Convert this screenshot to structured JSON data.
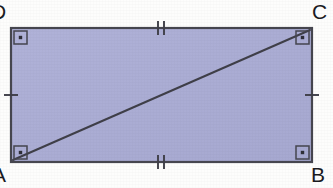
{
  "figure": {
    "kind": "geometry-diagram",
    "shape_name": "rectangle-with-diagonal",
    "colors": {
      "fill": "#aaacd4",
      "fill_light": "#b6b8de",
      "stroke": "#46464f",
      "diagonal": "#3f3f48",
      "label": "#1b1b1f",
      "background": "#fdfdfc"
    },
    "rect": {
      "x": 11,
      "y": 28,
      "width": 301,
      "height": 134,
      "stroke_width": 2.2
    },
    "diagonal": {
      "from": "A",
      "to": "C",
      "x1": 13,
      "y1": 160,
      "x2": 310,
      "y2": 30,
      "stroke_width": 2.0
    },
    "vertices": [
      {
        "id": "D",
        "label": "D",
        "position": "top-left",
        "x": 11,
        "y": 28,
        "right_angle": true,
        "clipped": true
      },
      {
        "id": "C",
        "label": "C",
        "position": "top-right",
        "x": 312,
        "y": 28,
        "right_angle": true,
        "clipped": false
      },
      {
        "id": "B",
        "label": "B",
        "position": "bottom-right",
        "x": 312,
        "y": 162,
        "right_angle": true,
        "clipped": false
      },
      {
        "id": "A",
        "label": "A",
        "position": "bottom-left",
        "x": 11,
        "y": 162,
        "right_angle": true,
        "clipped": true
      }
    ],
    "right_angle_marker": {
      "style": "square-with-center-dot",
      "size": 13,
      "dot_size": 3.4
    },
    "tick_marks": [
      {
        "side": "top",
        "edge": "DC",
        "count": 2,
        "orientation": "vertical",
        "center_x": 161,
        "center_y": 28,
        "length": 14
      },
      {
        "side": "bottom",
        "edge": "AB",
        "count": 2,
        "orientation": "vertical",
        "center_x": 161,
        "center_y": 162,
        "length": 14
      },
      {
        "side": "left",
        "edge": "AD",
        "count": 1,
        "orientation": "horizontal",
        "center_x": 11,
        "center_y": 95,
        "length": 14
      },
      {
        "side": "right",
        "edge": "BC",
        "count": 1,
        "orientation": "horizontal",
        "center_x": 312,
        "center_y": 95,
        "length": 14
      }
    ]
  }
}
